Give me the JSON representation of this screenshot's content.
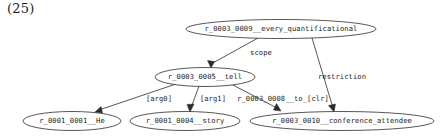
{
  "figure": {
    "number": "(25)"
  },
  "graph": {
    "nodes": [
      {
        "id": "n9",
        "label": "r_0003_0009__every_quantificational",
        "cx": 281,
        "cy": 29,
        "rx": 95,
        "ry": 9.5
      },
      {
        "id": "n5",
        "label": "r_0003_0005__tell",
        "cx": 205,
        "cy": 77,
        "rx": 50,
        "ry": 9.5
      },
      {
        "id": "n1",
        "label": "r_0001_0001__He",
        "cx": 72,
        "cy": 121,
        "rx": 49,
        "ry": 9.5
      },
      {
        "id": "n4",
        "label": "r_0001_0004__story",
        "cx": 185,
        "cy": 121,
        "rx": 55,
        "ry": 9.5
      },
      {
        "id": "n10",
        "label": "r_0003_0010__conference_attendee",
        "cx": 342,
        "cy": 121,
        "rx": 92,
        "ry": 9.5
      }
    ],
    "edges": [
      {
        "id": "e-scope",
        "from": "n9",
        "to": "n5",
        "label": "scope",
        "label_x": 261,
        "label_y": 53
      },
      {
        "id": "e-restriction",
        "from": "n9",
        "to": "n10",
        "label": "restriction",
        "label_x": 342,
        "label_y": 77
      },
      {
        "id": "e-arg0",
        "from": "n5",
        "to": "n1",
        "label": "[arg0]",
        "label_x": 159,
        "label_y": 99
      },
      {
        "id": "e-arg1",
        "from": "n5",
        "to": "n4",
        "label": "[arg1]",
        "label_x": 213,
        "label_y": 99
      },
      {
        "id": "e-to-clr",
        "from": "n5",
        "to": "n10",
        "label": "r_0003_0008__to_[clr]",
        "label_x": 283,
        "label_y": 99
      }
    ]
  }
}
